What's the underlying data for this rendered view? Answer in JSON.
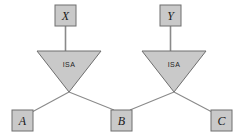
{
  "diagram": {
    "type": "er-isa-hierarchy",
    "colors": {
      "node_fill": "#c9c9c9",
      "node_stroke": "#6e6e6e",
      "triangle_fill": "#c9c9c9",
      "triangle_stroke": "#6e6e6e",
      "line": "#8a8a8a",
      "text": "#1a1a1a",
      "background": "#ffffff"
    },
    "entities": [
      {
        "id": "X",
        "label": "X",
        "x": 55,
        "y": 5,
        "w": 21,
        "h": 21
      },
      {
        "id": "Y",
        "label": "Y",
        "x": 160,
        "y": 5,
        "w": 21,
        "h": 21
      },
      {
        "id": "A",
        "label": "A",
        "x": 12,
        "y": 110,
        "w": 21,
        "h": 21
      },
      {
        "id": "B",
        "label": "B",
        "x": 111,
        "y": 110,
        "w": 21,
        "h": 21
      },
      {
        "id": "C",
        "label": "C",
        "x": 211,
        "y": 110,
        "w": 21,
        "h": 21
      }
    ],
    "triangles": [
      {
        "id": "isa-left",
        "label": "ISA",
        "left": 37,
        "right": 101,
        "top": 51,
        "apex_x": 69,
        "apex_y": 92
      },
      {
        "id": "isa-right",
        "label": "ISA",
        "left": 142,
        "right": 206,
        "top": 51,
        "apex_x": 174,
        "apex_y": 92
      }
    ],
    "edges": [
      {
        "id": "x-to-isa-left",
        "from": "X",
        "to": "isa-left",
        "x1": 65.5,
        "y1": 26,
        "x2": 65.5,
        "y2": 51
      },
      {
        "id": "y-to-isa-right",
        "from": "Y",
        "to": "isa-right",
        "x1": 170.5,
        "y1": 26,
        "x2": 170.5,
        "y2": 51
      },
      {
        "id": "isa-left-to-a",
        "from": "isa-left",
        "to": "A",
        "x1": 69,
        "y1": 92,
        "x2": 32,
        "y2": 112
      },
      {
        "id": "isa-left-to-b",
        "from": "isa-left",
        "to": "B",
        "x1": 69,
        "y1": 92,
        "x2": 113,
        "y2": 110
      },
      {
        "id": "isa-right-to-b",
        "from": "isa-right",
        "to": "B",
        "x1": 174,
        "y1": 92,
        "x2": 130,
        "y2": 110
      },
      {
        "id": "isa-right-to-c",
        "from": "isa-right",
        "to": "C",
        "x1": 174,
        "y1": 92,
        "x2": 212,
        "y2": 112
      }
    ]
  }
}
